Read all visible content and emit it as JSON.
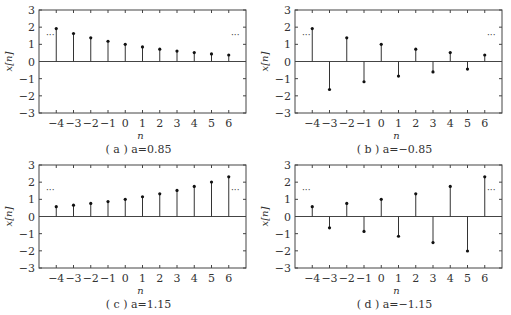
{
  "figure": {
    "shared": {
      "xlabel": "n",
      "ylabel": "x[n]",
      "ellipsis": "···",
      "x_ticks": [
        -4,
        -3,
        -2,
        -1,
        0,
        1,
        2,
        3,
        4,
        5,
        6
      ],
      "y_ticks": [
        -3,
        -2,
        -1,
        0,
        1,
        2,
        3
      ],
      "xlim": [
        -5,
        7
      ],
      "ylim": [
        -3,
        3
      ]
    },
    "panels": [
      {
        "id": "a",
        "caption": "( a ) a=0.85"
      },
      {
        "id": "b",
        "caption": "( b ) a=−0.85"
      },
      {
        "id": "c",
        "caption": "( c ) a=1.15"
      },
      {
        "id": "d",
        "caption": "( d ) a=−1.15"
      }
    ]
  },
  "chart_data": [
    {
      "type": "stem",
      "title": "( a ) a=0.85",
      "xlabel": "n",
      "ylabel": "x[n]",
      "xlim": [
        -5,
        7
      ],
      "ylim": [
        -3,
        3
      ],
      "grid": false,
      "x": [
        -4,
        -3,
        -2,
        -1,
        0,
        1,
        2,
        3,
        4,
        5,
        6
      ],
      "values": [
        1.92,
        1.63,
        1.38,
        1.18,
        1.0,
        0.85,
        0.72,
        0.61,
        0.52,
        0.44,
        0.38
      ],
      "annotations": [
        "··· (left, y≈1.5)",
        "··· (right, y≈1.5)"
      ]
    },
    {
      "type": "stem",
      "title": "( b ) a=−0.85",
      "xlabel": "n",
      "ylabel": "x[n]",
      "xlim": [
        -5,
        7
      ],
      "ylim": [
        -3,
        3
      ],
      "grid": false,
      "x": [
        -4,
        -3,
        -2,
        -1,
        0,
        1,
        2,
        3,
        4,
        5,
        6
      ],
      "values": [
        1.92,
        -1.63,
        1.38,
        -1.18,
        1.0,
        -0.85,
        0.72,
        -0.61,
        0.52,
        -0.44,
        0.38
      ],
      "annotations": [
        "··· (left, y≈1.5)",
        "··· (right, y≈1.5)"
      ]
    },
    {
      "type": "stem",
      "title": "( c ) a=1.15",
      "xlabel": "n",
      "ylabel": "x[n]",
      "xlim": [
        -5,
        7
      ],
      "ylim": [
        -3,
        3
      ],
      "grid": false,
      "x": [
        -4,
        -3,
        -2,
        -1,
        0,
        1,
        2,
        3,
        4,
        5,
        6
      ],
      "values": [
        0.57,
        0.66,
        0.76,
        0.87,
        1.0,
        1.15,
        1.32,
        1.52,
        1.75,
        2.01,
        2.31
      ],
      "annotations": [
        "··· (left, y≈1.5)",
        "··· (right, y≈1.5)"
      ]
    },
    {
      "type": "stem",
      "title": "( d ) a=−1.15",
      "xlabel": "n",
      "ylabel": "x[n]",
      "xlim": [
        -5,
        7
      ],
      "ylim": [
        -3,
        3
      ],
      "grid": false,
      "x": [
        -4,
        -3,
        -2,
        -1,
        0,
        1,
        2,
        3,
        4,
        5,
        6
      ],
      "values": [
        0.57,
        -0.66,
        0.76,
        -0.87,
        1.0,
        -1.15,
        1.32,
        -1.52,
        1.75,
        -2.01,
        2.31
      ],
      "annotations": [
        "··· (left, y≈1.5)",
        "··· (right, y≈1.5)"
      ]
    }
  ]
}
